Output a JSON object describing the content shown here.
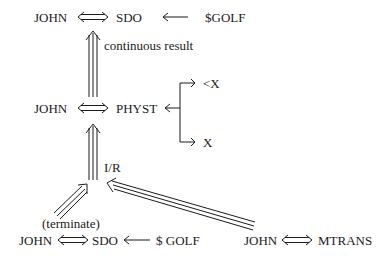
{
  "diagram": {
    "top": {
      "actor": "JOHN",
      "act": "SDO",
      "object": "$GOLF"
    },
    "top_link_label": "continuous result",
    "middle": {
      "actor": "JOHN",
      "act": "PHYST",
      "upper_branch": "<X",
      "lower_branch": "X"
    },
    "middle_link_label": "I/R",
    "bottom_left": {
      "label": "(terminate)",
      "actor": "JOHN",
      "act": "SDO",
      "object": "$ GOLF"
    },
    "bottom_right": {
      "actor": "JOHN",
      "act": "MTRANS"
    },
    "colors": {
      "ink": "#1a1a1a",
      "background": "#ffffff"
    }
  }
}
